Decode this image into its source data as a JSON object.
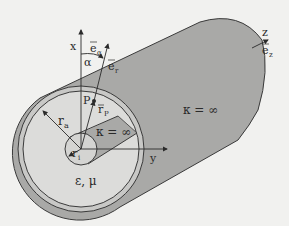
{
  "labels": {
    "x_axis": "x",
    "y_axis": "y",
    "z_axis": "z",
    "e_alpha": "e",
    "e_alpha_sub": "α",
    "e_r": "e",
    "e_r_sub": "r",
    "e_z": "e",
    "e_z_sub": "z",
    "alpha": "α",
    "point_p": "P",
    "r_p": "r",
    "r_p_sub": "P",
    "r_a": "r",
    "r_a_sub": "a",
    "r_i": "r",
    "r_i_sub": "i",
    "kappa_inner": "κ = ∞",
    "kappa_outer": "κ = ∞",
    "dielectric": "ε, μ"
  },
  "colors": {
    "background": "#f1f1ef",
    "conductor_fill": "#a9a9a7",
    "inner_conductor_fill": "#bdbdbb",
    "dielectric_fill": "#dcdcda",
    "stroke": "#3a3a3a"
  }
}
